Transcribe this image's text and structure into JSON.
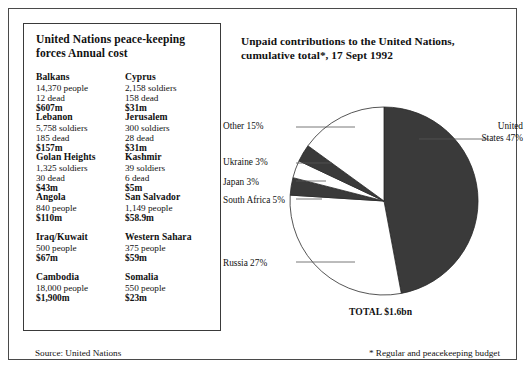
{
  "left_panel": {
    "title": "United Nations peace-keeping forces Annual cost",
    "operations": [
      {
        "name": "Balkans",
        "line1": "14,370 people",
        "line2": "12 dead",
        "cost": "$607m"
      },
      {
        "name": "Cyprus",
        "line1": "2,158 soldiers",
        "line2": "158 dead",
        "cost": "$31m"
      },
      {
        "name": "Lebanon",
        "line1": "5,758 soldiers",
        "line2": "185 dead",
        "cost": "$157m"
      },
      {
        "name": "Jerusalem",
        "line1": "300 soldiers",
        "line2": "28 dead",
        "cost": "$31m"
      },
      {
        "name": "Golan Heights",
        "line1": "1,325 soldiers",
        "line2": "30 dead",
        "cost": "$43m"
      },
      {
        "name": "Kashmir",
        "line1": "39 soldiers",
        "line2": "6 dead",
        "cost": "$5m"
      },
      {
        "name": "Angola",
        "line1": "840 people",
        "line2": "",
        "cost": "$110m"
      },
      {
        "name": "San Salvador",
        "line1": "1,149 people",
        "line2": "",
        "cost": "$58.9m"
      },
      {
        "name": "Iraq/Kuwait",
        "line1": "500 people",
        "line2": "",
        "cost": "$67m"
      },
      {
        "name": "Western Sahara",
        "line1": "375 people",
        "line2": "",
        "cost": "$59m"
      },
      {
        "name": "Cambodia",
        "line1": "18,000 people",
        "line2": "",
        "cost": "$1,900m"
      },
      {
        "name": "Somalia",
        "line1": "550 people",
        "line2": "",
        "cost": "$23m"
      }
    ]
  },
  "right_panel": {
    "title": "Unpaid contributions to the United Nations, cumulative total*, 17 Sept 1992",
    "total_label": "TOTAL $1.6bn",
    "labels": {
      "other": "Other 15%",
      "ukraine": "Ukraine 3%",
      "japan": "Japan 3%",
      "south_africa": "South Africa 5%",
      "russia": "Russia 27%",
      "united_states": "United States 47%"
    }
  },
  "footer": {
    "source": "Source: United Nations",
    "note": "* Regular and peacekeeping budget"
  },
  "chart_data": {
    "type": "pie",
    "title": "Unpaid contributions to the United Nations, cumulative total*, 17 Sept 1992",
    "total": "$1.6bn",
    "unit": "percent of total",
    "start_angle_deg": 0,
    "direction": "clockwise",
    "categories": [
      "United States",
      "Russia",
      "South Africa",
      "Japan",
      "Ukraine",
      "Other"
    ],
    "values": [
      47,
      27,
      5,
      3,
      3,
      15
    ],
    "colors": [
      "#3a3a3a",
      "#ffffff",
      "#3a3a3a",
      "#ffffff",
      "#3a3a3a",
      "#ffffff"
    ],
    "legend": "leader-line callouts around pie"
  }
}
